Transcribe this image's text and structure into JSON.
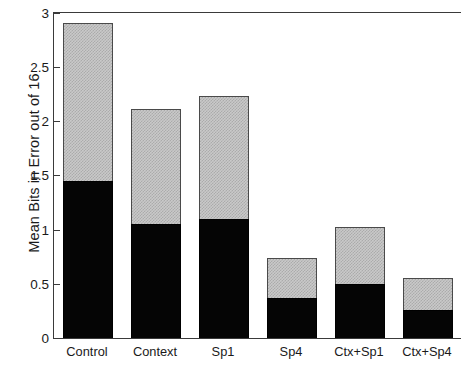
{
  "chart": {
    "ylabel": "Mean Bits in Error out of 16",
    "xlabel": "",
    "title": ""
  },
  "axis": {
    "yticks": [
      "0",
      "0.5",
      "1",
      "1.5",
      "2",
      "2.5",
      "3"
    ],
    "ymin": 0,
    "ymax": 3
  },
  "colors": {
    "black_segment": "#050505",
    "gray_segment": "#c9c9c9",
    "axis": "#3a3a3a",
    "text": "#1a1a1a",
    "background": "#ffffff"
  },
  "chart_data": {
    "type": "bar",
    "subtype": "stacked",
    "title": "",
    "xlabel": "",
    "ylabel": "Mean Bits in Error out of 16",
    "ylim": [
      0,
      3
    ],
    "yticks": [
      0,
      0.5,
      1,
      1.5,
      2,
      2.5,
      3
    ],
    "grid": false,
    "legend": "none",
    "categories": [
      "Control",
      "Context",
      "Sp1",
      "Sp4",
      "Ctx+Sp1",
      "Ctx+Sp4"
    ],
    "series": [
      {
        "name": "lower (black)",
        "color": "#050505",
        "values": [
          1.45,
          1.05,
          1.1,
          0.37,
          0.5,
          0.26
        ]
      },
      {
        "name": "upper (gray)",
        "color": "#c9c9c9",
        "values": [
          1.45,
          1.06,
          1.13,
          0.37,
          0.52,
          0.29
        ]
      }
    ],
    "totals": [
      2.9,
      2.11,
      2.23,
      0.74,
      1.02,
      0.55
    ]
  }
}
